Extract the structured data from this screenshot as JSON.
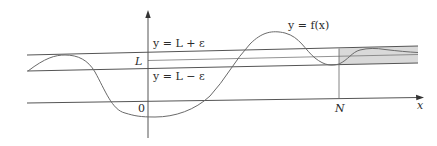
{
  "diagram": {
    "labels": {
      "upper_band": "y = L + ε",
      "lower_band": "y = L − ε",
      "limit_value": "L",
      "curve": "y = f(x)",
      "origin": "0",
      "threshold": "N",
      "x_axis": "x"
    },
    "colors": {
      "line": "#555555",
      "curve": "#6a6a6a",
      "shade": "#d9d9d9",
      "background": "#ffffff"
    }
  }
}
